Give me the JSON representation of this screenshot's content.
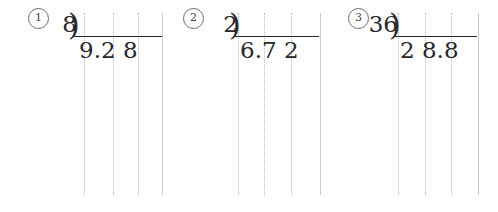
{
  "worksheet": {
    "title": "Long division practice problems",
    "paper": "grid-ruled",
    "background_color": "#ffffff",
    "ink_color": "#26262b",
    "guide_line_color": "#b9b9bf"
  },
  "problems": [
    {
      "index_label": "①",
      "index_digit": "1",
      "divisor": "8",
      "dividend": "9.2 8",
      "expression": "8)9.2 8",
      "bracket_symbol": ")",
      "index_x": 28,
      "index_y": 8,
      "expr_left": 77,
      "expr_top": 36,
      "vinculum_width": 88,
      "guides": [
        84,
        113,
        138,
        162
      ]
    },
    {
      "index_label": "②",
      "index_digit": "2",
      "divisor": "2",
      "dividend": "6.7 2",
      "expression": "2)6.7 2",
      "bracket_symbol": ")",
      "index_x": 183,
      "index_y": 8,
      "expr_left": 238,
      "expr_top": 36,
      "vinculum_width": 84,
      "guides": [
        238,
        264,
        291,
        320
      ]
    },
    {
      "index_label": "③",
      "index_digit": "3",
      "divisor": "36",
      "dividend": "2 8.8",
      "expression": "36)2 8.8",
      "bracket_symbol": ")",
      "index_x": 348,
      "index_y": 8,
      "expr_left": 398,
      "expr_top": 36,
      "vinculum_width": 82,
      "guides": [
        398,
        425,
        451,
        478
      ]
    }
  ]
}
